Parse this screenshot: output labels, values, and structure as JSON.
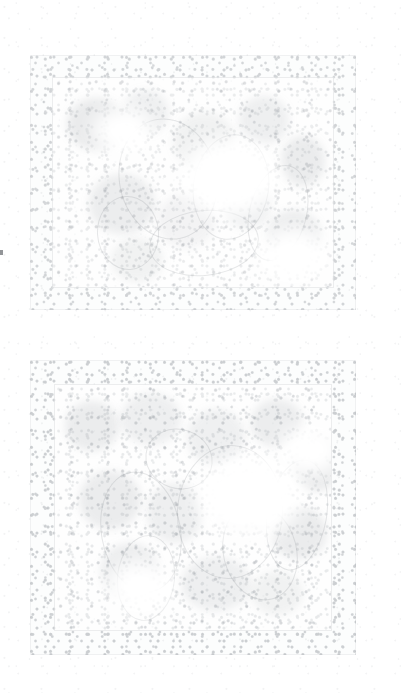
{
  "document": {
    "kind": "scanned-page",
    "title": "Faded scanned page with two illustration plates",
    "page_background": "#ffffff",
    "width": 402,
    "height": 693,
    "legible_text": "",
    "notes": "Severely faded / washed-out scan. No legible text, captions, page numbers or UI chrome are rendered in the pixels."
  },
  "palette": {
    "paper": "#ffffff",
    "grain": "#9aa0a6",
    "border_ink": "#787f88",
    "frame_line": "#767c84",
    "figure_ink": "#6f767f",
    "speck": "#3a3e44"
  },
  "plates": [
    {
      "id": "plate-top",
      "label": "Upper illustration plate",
      "bounds": {
        "x": 30,
        "y": 55,
        "width": 326,
        "height": 255
      },
      "inner_frame": {
        "inset": 22
      },
      "border_opacity": 0.3,
      "field_opacity": 0.22,
      "blooms": [
        {
          "x": 14,
          "y": 20,
          "w": 58,
          "h": 52,
          "o": 0.14
        },
        {
          "x": 70,
          "y": 12,
          "w": 46,
          "h": 44,
          "o": 0.1
        },
        {
          "x": 120,
          "y": 34,
          "w": 62,
          "h": 58,
          "o": 0.09
        },
        {
          "x": 186,
          "y": 18,
          "w": 50,
          "h": 48,
          "o": 0.11
        },
        {
          "x": 228,
          "y": 58,
          "w": 44,
          "h": 50,
          "o": 0.13
        },
        {
          "x": 36,
          "y": 96,
          "w": 66,
          "h": 60,
          "o": 0.12
        },
        {
          "x": 104,
          "y": 116,
          "w": 58,
          "h": 54,
          "o": 0.08
        },
        {
          "x": 170,
          "y": 104,
          "w": 48,
          "h": 46,
          "o": 0.1
        },
        {
          "x": 214,
          "y": 132,
          "w": 54,
          "h": 50,
          "o": 0.12
        },
        {
          "x": 58,
          "y": 160,
          "w": 52,
          "h": 44,
          "o": 0.09
        }
      ],
      "contours": [
        {
          "x": 66,
          "y": 40,
          "w": 96,
          "h": 120,
          "round": true,
          "rot": -12
        },
        {
          "x": 140,
          "y": 56,
          "w": 74,
          "h": 104,
          "round": true,
          "rot": 8
        },
        {
          "x": 44,
          "y": 118,
          "w": 60,
          "h": 72,
          "round": true,
          "rot": -4
        },
        {
          "x": 196,
          "y": 86,
          "w": 56,
          "h": 96,
          "round": true,
          "rot": 14
        },
        {
          "x": 96,
          "y": 132,
          "w": 108,
          "h": 64,
          "round": true,
          "rot": -6
        }
      ],
      "washes": [
        {
          "x": 128,
          "y": 60,
          "w": 96,
          "h": 78
        },
        {
          "x": 40,
          "y": 30,
          "w": 60,
          "h": 46
        },
        {
          "x": 206,
          "y": 150,
          "w": 70,
          "h": 56
        }
      ]
    },
    {
      "id": "plate-bottom",
      "label": "Lower illustration plate",
      "bounds": {
        "x": 30,
        "y": 360,
        "width": 326,
        "height": 295
      },
      "inner_frame": {
        "inset": 24
      },
      "border_opacity": 0.34,
      "field_opacity": 0.26,
      "blooms": [
        {
          "x": 10,
          "y": 16,
          "w": 54,
          "h": 50,
          "o": 0.13
        },
        {
          "x": 66,
          "y": 8,
          "w": 60,
          "h": 52,
          "o": 0.11
        },
        {
          "x": 132,
          "y": 24,
          "w": 58,
          "h": 56,
          "o": 0.1
        },
        {
          "x": 196,
          "y": 14,
          "w": 52,
          "h": 48,
          "o": 0.12
        },
        {
          "x": 238,
          "y": 52,
          "w": 48,
          "h": 54,
          "o": 0.14
        },
        {
          "x": 24,
          "y": 86,
          "w": 62,
          "h": 58,
          "o": 0.13
        },
        {
          "x": 92,
          "y": 98,
          "w": 56,
          "h": 60,
          "o": 0.11
        },
        {
          "x": 158,
          "y": 88,
          "w": 64,
          "h": 58,
          "o": 0.1
        },
        {
          "x": 216,
          "y": 122,
          "w": 56,
          "h": 52,
          "o": 0.13
        },
        {
          "x": 46,
          "y": 158,
          "w": 58,
          "h": 56,
          "o": 0.12
        },
        {
          "x": 126,
          "y": 172,
          "w": 70,
          "h": 54,
          "o": 0.11
        },
        {
          "x": 196,
          "y": 186,
          "w": 52,
          "h": 44,
          "o": 0.09
        }
      ],
      "contours": [
        {
          "x": 46,
          "y": 86,
          "w": 78,
          "h": 120,
          "round": true,
          "rot": -10
        },
        {
          "x": 62,
          "y": 150,
          "w": 56,
          "h": 84,
          "round": true,
          "rot": 6
        },
        {
          "x": 122,
          "y": 60,
          "w": 104,
          "h": 132,
          "round": true,
          "rot": 4
        },
        {
          "x": 168,
          "y": 118,
          "w": 72,
          "h": 96,
          "round": true,
          "rot": -14
        },
        {
          "x": 90,
          "y": 44,
          "w": 66,
          "h": 58,
          "round": true,
          "rot": 18
        },
        {
          "x": 212,
          "y": 74,
          "w": 58,
          "h": 110,
          "round": true,
          "rot": 10
        }
      ],
      "washes": [
        {
          "x": 142,
          "y": 70,
          "w": 104,
          "h": 84
        },
        {
          "x": 52,
          "y": 176,
          "w": 66,
          "h": 52
        },
        {
          "x": 224,
          "y": 40,
          "w": 62,
          "h": 50
        }
      ]
    }
  ],
  "marks": [
    {
      "id": "left-edge-speck",
      "label": "Dark speck at left sheet margin",
      "x": 0,
      "y": 250,
      "width": 3,
      "height": 5
    }
  ]
}
